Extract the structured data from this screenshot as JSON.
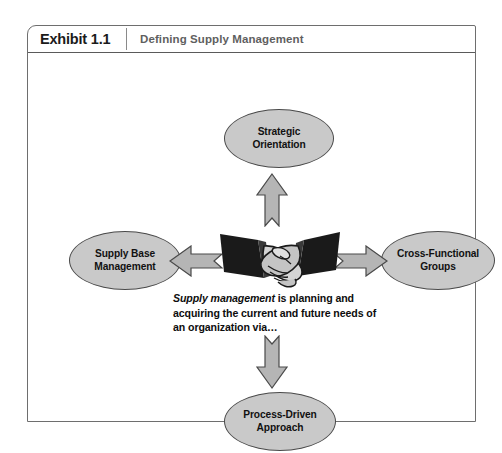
{
  "exhibit": {
    "label": "Exhibit 1.1",
    "title": "Defining Supply Management"
  },
  "diagram": {
    "type": "hub-and-spoke",
    "center_icon": "handshake-icon",
    "definition": {
      "term": "Supply management",
      "rest": " is planning and acquiring the current and future needs of an organization via…",
      "full_text": "Supply management is planning and acquiring the current and future needs of an organization via…"
    },
    "nodes": [
      {
        "id": "strategic-orientation",
        "position": "top",
        "line1": "Strategic",
        "line2": "Orientation"
      },
      {
        "id": "supply-base-management",
        "position": "left",
        "line1": "Supply Base",
        "line2": "Management"
      },
      {
        "id": "cross-functional-groups",
        "position": "right",
        "line1": "Cross-Functional",
        "line2": "Groups"
      },
      {
        "id": "process-driven-approach",
        "position": "bottom",
        "line1": "Process-Driven",
        "line2": "Approach"
      }
    ],
    "arrows": [
      {
        "id": "arrow-up",
        "direction": "up",
        "from": "center",
        "to": "strategic-orientation"
      },
      {
        "id": "arrow-left",
        "direction": "left",
        "from": "center",
        "to": "supply-base-management"
      },
      {
        "id": "arrow-right",
        "direction": "right",
        "from": "center",
        "to": "cross-functional-groups"
      },
      {
        "id": "arrow-down",
        "direction": "down",
        "from": "center",
        "to": "process-driven-approach"
      }
    ]
  },
  "colors": {
    "node_fill": "#c9c9c9",
    "node_border": "#4a4a4a",
    "arrow_fill": "#b5b5b5",
    "arrow_border": "#4a4a4a",
    "frame_border": "#6e6e6e",
    "header_title": "#5f5f5f",
    "text": "#111111",
    "sleeve": "#1a1a1a",
    "hand": "#d0d0d0"
  }
}
